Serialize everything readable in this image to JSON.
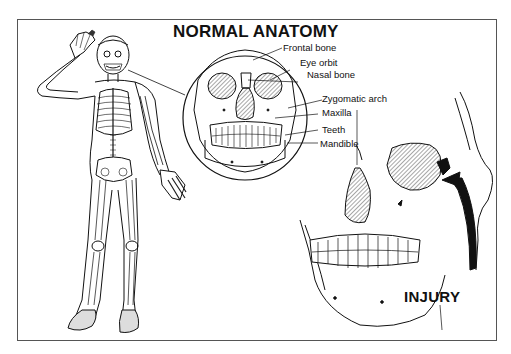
{
  "diagram": {
    "title": "NORMAL ANATOMY",
    "labels": [
      {
        "id": "frontal",
        "text": "Frontal bone"
      },
      {
        "id": "orbit",
        "text": "Eye orbit"
      },
      {
        "id": "nasal",
        "text": "Nasal bone"
      },
      {
        "id": "zygomatic",
        "text": "Zygomatic arch"
      },
      {
        "id": "maxilla",
        "text": "Maxilla"
      },
      {
        "id": "teeth",
        "text": "Teeth"
      },
      {
        "id": "mandible",
        "text": "Mandible"
      }
    ],
    "injury_label": "INJURY",
    "panels": {
      "figure": "full-body-skeleton",
      "inset": "front-view-skull-normal",
      "detail": "skull-with-orbital-fracture"
    },
    "colors": {
      "line": "#111111",
      "background": "#ffffff",
      "frame": "#555555"
    }
  }
}
